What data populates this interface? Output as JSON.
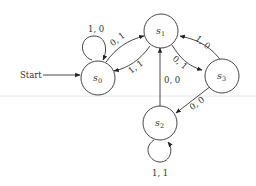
{
  "diagram": {
    "type": "finite-state-machine",
    "start_label": "Start",
    "states": [
      {
        "id": "s0",
        "base": "s",
        "sub": "0"
      },
      {
        "id": "s1",
        "base": "s",
        "sub": "1"
      },
      {
        "id": "s2",
        "base": "s",
        "sub": "2"
      },
      {
        "id": "s3",
        "base": "s",
        "sub": "3"
      }
    ],
    "transitions": [
      {
        "from": "s0",
        "to": "s0",
        "label": "1, 0"
      },
      {
        "from": "s0",
        "to": "s1",
        "label": "0, 1"
      },
      {
        "from": "s1",
        "to": "s0",
        "label": "1, 1"
      },
      {
        "from": "s1",
        "to": "s3",
        "label": "0, 1"
      },
      {
        "from": "s3",
        "to": "s1",
        "label": "1, 0"
      },
      {
        "from": "s3",
        "to": "s2",
        "label": "0, 0"
      },
      {
        "from": "s2",
        "to": "s1",
        "label": "0, 0"
      },
      {
        "from": "s2",
        "to": "s2",
        "label": "1, 1"
      }
    ]
  }
}
